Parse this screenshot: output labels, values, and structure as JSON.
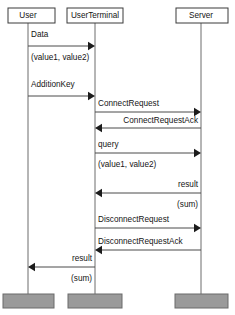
{
  "diagram": {
    "kind": "sequence-diagram",
    "width": 235,
    "height": 315,
    "colors": {
      "background": "#ffffff",
      "box_stroke": "#3a3a3a",
      "lifeline": "#6d6d6d",
      "message": "#4a4a4a",
      "arrowhead": "#1c1c1c",
      "foot_bar_fill": "#9a9a9a",
      "text": "#141414"
    }
  },
  "lifelines": [
    {
      "id": "user",
      "label": "User",
      "x": 28,
      "box_x": 8,
      "box_w": 47
    },
    {
      "id": "user_terminal",
      "label": "UserTerminal",
      "x": 95,
      "box_x": 67,
      "box_w": 56
    },
    {
      "id": "server",
      "label": "Server",
      "x": 201,
      "box_x": 176,
      "box_w": 52
    }
  ],
  "foot_bars": [
    {
      "id": "user-foot",
      "x": 3,
      "w": 51
    },
    {
      "id": "terminal-foot",
      "x": 68,
      "w": 54
    },
    {
      "id": "server-foot",
      "x": 175,
      "w": 53
    }
  ],
  "messages": [
    {
      "id": "data",
      "label": "Data",
      "sublabel": "(value1, value2)",
      "from": "user",
      "to": "user_terminal",
      "direction": "right",
      "y": 46,
      "label_y": 37,
      "sublabel_y": 60,
      "label_align": "start",
      "sublabel_align": "start"
    },
    {
      "id": "addition-key",
      "label": "AdditionKey",
      "sublabel": "",
      "from": "user",
      "to": "user_terminal",
      "direction": "right",
      "y": 96,
      "label_y": 87,
      "sublabel_y": 0,
      "label_align": "start",
      "sublabel_align": "start"
    },
    {
      "id": "connect-request",
      "label": "ConnectRequest",
      "sublabel": "",
      "from": "user_terminal",
      "to": "server",
      "direction": "right",
      "y": 112,
      "label_y": 106,
      "sublabel_y": 0,
      "label_align": "start",
      "sublabel_align": "start"
    },
    {
      "id": "connect-request-ack",
      "label": "ConnectRequestAck",
      "sublabel": "",
      "from": "server",
      "to": "user_terminal",
      "direction": "left",
      "y": 128,
      "label_y": 123,
      "sublabel_y": 0,
      "label_align": "end",
      "sublabel_align": "end"
    },
    {
      "id": "query",
      "label": "query",
      "sublabel": "(value1, value2)",
      "from": "user_terminal",
      "to": "server",
      "direction": "right",
      "y": 153,
      "label_y": 147,
      "sublabel_y": 167,
      "label_align": "start",
      "sublabel_align": "start"
    },
    {
      "id": "result-server",
      "label": "result",
      "sublabel": "(sum)",
      "from": "server",
      "to": "user_terminal",
      "direction": "left",
      "y": 193,
      "label_y": 187,
      "sublabel_y": 207,
      "label_align": "end",
      "sublabel_align": "end"
    },
    {
      "id": "disconnect-request",
      "label": "DisconnectRequest",
      "sublabel": "",
      "from": "user_terminal",
      "to": "server",
      "direction": "right",
      "y": 228,
      "label_y": 222,
      "sublabel_y": 0,
      "label_align": "start",
      "sublabel_align": "start"
    },
    {
      "id": "disconnect-request-ack",
      "label": "DisconnectRequestAck",
      "sublabel": "",
      "from": "server",
      "to": "user_terminal",
      "direction": "left",
      "y": 250,
      "label_y": 244,
      "sublabel_y": 0,
      "label_align": "start",
      "sublabel_align": "start"
    },
    {
      "id": "result-user",
      "label": "result",
      "sublabel": "(sum)",
      "from": "user_terminal",
      "to": "user",
      "direction": "left",
      "y": 267,
      "label_y": 261,
      "sublabel_y": 281,
      "label_align": "end",
      "sublabel_align": "end"
    }
  ]
}
